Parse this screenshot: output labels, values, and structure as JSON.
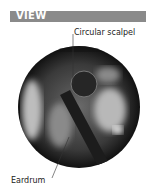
{
  "header": {
    "title": "VIEW",
    "color": "#8a8a8a"
  },
  "labels": {
    "top": "Circular scalpel",
    "bottom": "Eardrum"
  },
  "image": {
    "description": "endoscopic view of ear canal with circular scalpel near eardrum"
  }
}
